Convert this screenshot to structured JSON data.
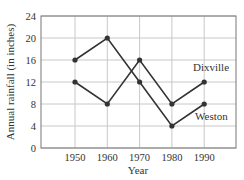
{
  "chart_data": {
    "type": "line",
    "title": "",
    "xlabel": "Year",
    "ylabel": "Annual rainfall (in inches)",
    "x": [
      1950,
      1960,
      1970,
      1980,
      1990
    ],
    "x_tick_labels": [
      "1950",
      "1960",
      "1970",
      "1980",
      "1990"
    ],
    "y_tick_labels": [
      "0",
      "4",
      "8",
      "12",
      "16",
      "20",
      "24"
    ],
    "ylim": [
      0,
      24
    ],
    "grid": true,
    "legend": "inline labels near series end",
    "series": [
      {
        "name": "Dixville",
        "values": [
          12,
          8,
          16,
          8,
          12
        ]
      },
      {
        "name": "Weston",
        "values": [
          16,
          20,
          12,
          4,
          8
        ]
      }
    ]
  },
  "colors": {
    "line": "#333333",
    "grid": "#c8c8c8",
    "axis": "#555555"
  }
}
